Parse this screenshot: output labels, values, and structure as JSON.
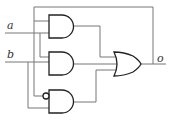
{
  "diagram": {
    "type": "logic-circuit",
    "inputs": [
      {
        "id": "a",
        "label": "a"
      },
      {
        "id": "b",
        "label": "b"
      }
    ],
    "output": {
      "id": "o",
      "label": "o"
    },
    "gates": [
      {
        "id": "and1",
        "type": "AND",
        "inputs": [
          "o (feedback)",
          "a"
        ]
      },
      {
        "id": "and2",
        "type": "AND",
        "inputs": [
          "a",
          "b"
        ]
      },
      {
        "id": "and3",
        "type": "AND",
        "inputs": [
          "NOT a",
          "b"
        ],
        "inverted_input": true
      },
      {
        "id": "or1",
        "type": "OR",
        "inputs": [
          "and1",
          "and2",
          "and3"
        ],
        "output": "o"
      }
    ],
    "colors": {
      "wire": "#777777",
      "gate": "#222222",
      "background": "#ffffff"
    }
  }
}
